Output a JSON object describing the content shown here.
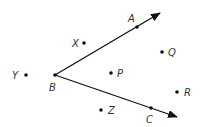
{
  "diagram": {
    "vertex": {
      "label": "B",
      "x": 55,
      "y": 75
    },
    "rays": [
      {
        "name": "ray-BA",
        "through": {
          "label": "A",
          "x": 137,
          "y": 27
        },
        "tip": {
          "x": 160,
          "y": 13
        }
      },
      {
        "name": "ray-BC",
        "through": {
          "label": "C",
          "x": 151,
          "y": 108
        },
        "tip": {
          "x": 177,
          "y": 117
        }
      }
    ],
    "points": [
      {
        "label": "X",
        "x": 84,
        "y": 43,
        "lx": 72,
        "ly": 47
      },
      {
        "label": "Y",
        "x": 26,
        "y": 75,
        "lx": 12,
        "ly": 79
      },
      {
        "label": "P",
        "x": 111,
        "y": 73,
        "lx": 117,
        "ly": 77
      },
      {
        "label": "Q",
        "x": 162,
        "y": 52,
        "lx": 168,
        "ly": 56
      },
      {
        "label": "R",
        "x": 177,
        "y": 92,
        "lx": 184,
        "ly": 96
      },
      {
        "label": "Z",
        "x": 101,
        "y": 110,
        "lx": 108,
        "ly": 114
      }
    ],
    "labels": {
      "A": {
        "text": "A",
        "x": 128,
        "y": 22
      },
      "B": {
        "text": "B",
        "x": 49,
        "y": 91
      },
      "C": {
        "text": "C",
        "x": 146,
        "y": 123
      }
    }
  }
}
